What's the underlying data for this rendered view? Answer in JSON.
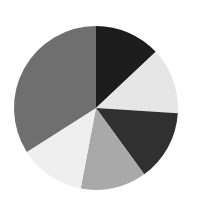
{
  "chart_data": {
    "type": "pie",
    "title": "",
    "categories": [
      "Slice 1",
      "Slice 2",
      "Slice 3",
      "Slice 4",
      "Slice 5",
      "Slice 6"
    ],
    "values": [
      13,
      13,
      14,
      13,
      13,
      34
    ],
    "colors": [
      "#1c1c1c",
      "#e6e6e6",
      "#303030",
      "#a9a9a9",
      "#efefef",
      "#6f6f6f"
    ],
    "start_angle_deg": 0,
    "direction": "clockwise",
    "legend": "none",
    "labels_shown": false
  },
  "layout": {
    "center_x": 96,
    "center_y": 108,
    "radius": 82
  }
}
